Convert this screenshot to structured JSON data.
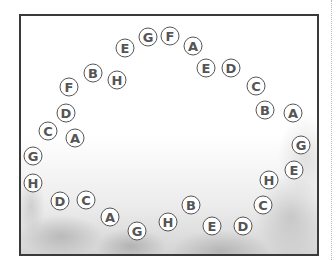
{
  "puzzle": {
    "tokens": [
      {
        "letter": "G",
        "x": 148,
        "y": 37
      },
      {
        "letter": "F",
        "x": 170,
        "y": 36
      },
      {
        "letter": "A",
        "x": 193,
        "y": 46
      },
      {
        "letter": "E",
        "x": 206,
        "y": 68
      },
      {
        "letter": "D",
        "x": 231,
        "y": 68
      },
      {
        "letter": "C",
        "x": 256,
        "y": 86
      },
      {
        "letter": "B",
        "x": 265,
        "y": 110
      },
      {
        "letter": "A",
        "x": 293,
        "y": 113
      },
      {
        "letter": "G",
        "x": 301,
        "y": 145
      },
      {
        "letter": "E",
        "x": 294,
        "y": 170
      },
      {
        "letter": "H",
        "x": 269,
        "y": 180
      },
      {
        "letter": "C",
        "x": 263,
        "y": 205
      },
      {
        "letter": "D",
        "x": 243,
        "y": 226
      },
      {
        "letter": "E",
        "x": 212,
        "y": 226
      },
      {
        "letter": "B",
        "x": 191,
        "y": 205
      },
      {
        "letter": "H",
        "x": 168,
        "y": 222
      },
      {
        "letter": "G",
        "x": 137,
        "y": 231
      },
      {
        "letter": "A",
        "x": 110,
        "y": 217
      },
      {
        "letter": "C",
        "x": 86,
        "y": 200
      },
      {
        "letter": "D",
        "x": 60,
        "y": 201
      },
      {
        "letter": "H",
        "x": 33,
        "y": 183
      },
      {
        "letter": "G",
        "x": 33,
        "y": 156
      },
      {
        "letter": "C",
        "x": 48,
        "y": 131
      },
      {
        "letter": "A",
        "x": 75,
        "y": 138
      },
      {
        "letter": "D",
        "x": 66,
        "y": 113
      },
      {
        "letter": "F",
        "x": 69,
        "y": 87
      },
      {
        "letter": "B",
        "x": 93,
        "y": 73
      },
      {
        "letter": "H",
        "x": 117,
        "y": 80
      },
      {
        "letter": "E",
        "x": 125,
        "y": 48
      }
    ]
  }
}
